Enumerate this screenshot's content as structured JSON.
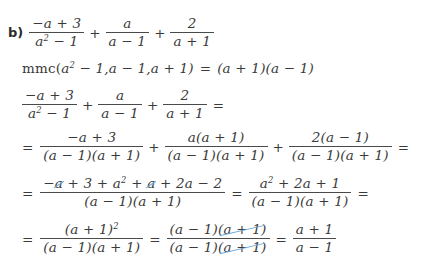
{
  "problem": {
    "label": "b)",
    "cancel_color": "#6ca8d8",
    "ink_color": "#3a3a3a"
  },
  "symbols": {
    "plus": "+",
    "minus": "−",
    "equals": "=",
    "lparen": "(",
    "rparen": ")"
  },
  "line1": {
    "name": "original-expression",
    "frac1": {
      "num": "−a + 3",
      "den_base": "a",
      "den_exp": "2",
      "den_rest": " − 1"
    },
    "op1": "+",
    "frac2": {
      "num": "a",
      "den": "a − 1"
    },
    "op2": "+",
    "frac3": {
      "num": "2",
      "den": "a + 1"
    }
  },
  "line2": {
    "name": "lcm-statement",
    "fn": "mmc(",
    "arg1_base": "a",
    "arg1_exp": "2",
    "arg1_rest": " − 1, ",
    "arg2": "a − 1, ",
    "arg3": "a + 1)",
    "equals": "=",
    "result": "(a + 1)(a − 1)"
  },
  "line3": {
    "name": "restated-expression",
    "frac1": {
      "num": "−a + 3",
      "den_base": "a",
      "den_exp": "2",
      "den_rest": " − 1"
    },
    "op1": "+",
    "frac2": {
      "num": "a",
      "den": "a − 1"
    },
    "op2": "+",
    "frac3": {
      "num": "2",
      "den": "a + 1"
    },
    "trailing_equals": "="
  },
  "line4": {
    "name": "common-denominator-step",
    "lead_equals": "=",
    "frac1": {
      "num": "−a + 3",
      "den": "(a − 1)(a + 1)"
    },
    "op1": "+",
    "frac2": {
      "num": "a(a + 1)",
      "den": "(a − 1)(a + 1)"
    },
    "op2": "+",
    "frac3": {
      "num": "2(a − 1)",
      "den": "(a − 1)(a + 1)"
    },
    "trailing_equals": "="
  },
  "line5": {
    "name": "expanded-numerator-step",
    "lead_equals": "=",
    "frac1": {
      "num_minus": "−",
      "num_cancel_a1": "a",
      "num_mid": " + 3 + ",
      "num_a_base": "a",
      "num_a_exp": "2",
      "num_plus": " + ",
      "num_cancel_a2": "a",
      "num_tail": " + 2a − 2",
      "den": "(a − 1)(a + 1)"
    },
    "equals": "=",
    "frac2": {
      "num_base": "a",
      "num_exp": "2",
      "num_rest": " + 2a + 1",
      "den": "(a − 1)(a + 1)"
    },
    "trailing_equals": "="
  },
  "line6": {
    "name": "factored-and-simplified-step",
    "lead_equals": "=",
    "frac1": {
      "num_base": "(a + 1)",
      "num_exp": "2",
      "den": "(a − 1)(a + 1)"
    },
    "equals1": "=",
    "frac2": {
      "num_keep": "(a − 1)",
      "num_cancel": "(a + 1)",
      "den_keep": "(a − 1)",
      "den_cancel": "(a + 1)"
    },
    "equals2": "=",
    "frac3": {
      "num": "a + 1",
      "den": "a − 1"
    }
  }
}
